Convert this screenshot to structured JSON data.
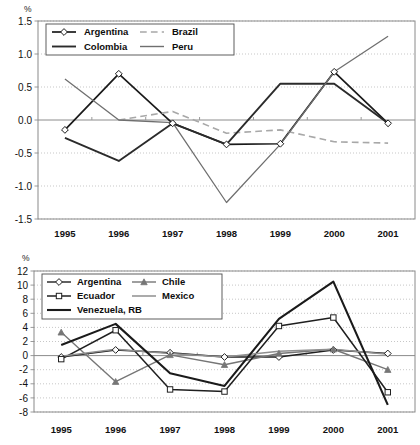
{
  "chart_data": [
    {
      "id": "top",
      "type": "line",
      "title": "",
      "subtitle": "",
      "xlabel": "",
      "ylabel": "%",
      "unit_label": "%",
      "categories": [
        "1995",
        "1996",
        "1997",
        "1998",
        "1999",
        "2000",
        "2001"
      ],
      "ylim": [
        -1.5,
        1.5
      ],
      "ytick_values": [
        1.5,
        1.0,
        0.5,
        0.0,
        -0.5,
        -1.0,
        -1.5
      ],
      "ytick_labels": [
        "1.5",
        "1.0",
        "0.5",
        "0.0",
        "-0.5",
        "-1.0",
        "-1.5"
      ],
      "grid": true,
      "legend_position": "top-left-inside",
      "series": [
        {
          "name": "Argentina",
          "color": "#1a1a1a",
          "width": 1.7,
          "dash": "none",
          "marker": "diamond",
          "values": [
            -0.15,
            0.7,
            -0.05,
            -0.37,
            -0.36,
            0.73,
            -0.05
          ]
        },
        {
          "name": "Brazil",
          "color": "#a8a8a8",
          "width": 1.6,
          "dash": "long",
          "marker": "none",
          "values": [
            null,
            0.0,
            0.13,
            -0.2,
            -0.15,
            -0.33,
            -0.35
          ]
        },
        {
          "name": "Colombia",
          "color": "#2b2b2b",
          "width": 1.9,
          "dash": "none",
          "marker": "none",
          "values": [
            -0.27,
            -0.62,
            -0.05,
            -0.37,
            0.55,
            0.55,
            -0.05
          ]
        },
        {
          "name": "Peru",
          "color": "#6f6f6f",
          "width": 1.3,
          "dash": "none",
          "marker": "none",
          "values": [
            0.62,
            0.0,
            -0.04,
            -1.25,
            -0.37,
            0.73,
            1.27
          ]
        }
      ]
    },
    {
      "id": "bottom",
      "type": "line",
      "title": "",
      "subtitle": "",
      "xlabel": "",
      "ylabel": "%",
      "unit_label": "%",
      "categories": [
        "1995",
        "1996",
        "1997",
        "1998",
        "1999",
        "2000",
        "2001"
      ],
      "ylim": [
        -8,
        12
      ],
      "ytick_values": [
        12,
        10,
        8,
        6,
        4,
        2,
        0,
        -2,
        -4,
        -6,
        -8
      ],
      "ytick_labels": [
        "12",
        "10",
        "8",
        "6",
        "4",
        "2",
        "0",
        "-2",
        "-4",
        "-6",
        "-8"
      ],
      "grid": true,
      "legend_position": "top-left-inside",
      "series": [
        {
          "name": "Argentina",
          "color": "#1f1f1f",
          "width": 1.4,
          "dash": "none",
          "marker": "diamond",
          "values": [
            -0.2,
            0.8,
            0.4,
            -0.2,
            -0.2,
            0.8,
            0.3
          ]
        },
        {
          "name": "Chile",
          "color": "#767676",
          "width": 1.4,
          "dash": "none",
          "marker": "triangle",
          "values": [
            3.3,
            -3.7,
            0.1,
            -1.3,
            0.3,
            0.9,
            -2.0
          ]
        },
        {
          "name": "Ecuador",
          "color": "#1f1f1f",
          "width": 1.5,
          "dash": "none",
          "marker": "square",
          "values": [
            -0.5,
            3.6,
            -4.8,
            -5.1,
            4.2,
            5.4,
            -5.2
          ]
        },
        {
          "name": "Mexico",
          "color": "#8f8f8f",
          "width": 1.5,
          "dash": "none",
          "marker": "none",
          "values": [
            -0.1,
            0.9,
            0.3,
            -0.2,
            0.6,
            0.9,
            0.2
          ]
        },
        {
          "name": "Venezuela, RB",
          "color": "#1a1a1a",
          "width": 2.1,
          "dash": "none",
          "marker": "none",
          "values": [
            1.5,
            4.5,
            -2.5,
            -4.3,
            5.2,
            10.5,
            -7.0
          ]
        }
      ]
    }
  ]
}
